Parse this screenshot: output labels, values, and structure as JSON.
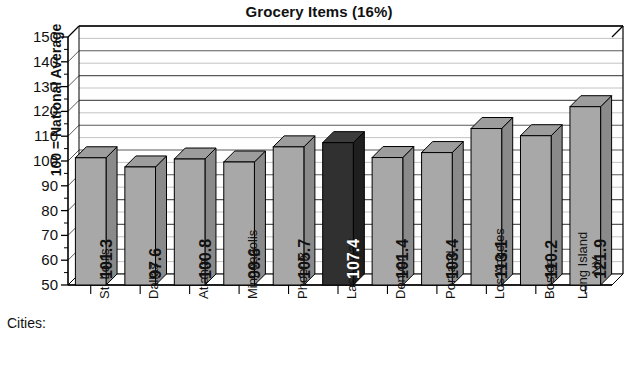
{
  "chart_data": {
    "type": "bar",
    "title": "Grocery Items (16%)",
    "xlabel": "Cities:",
    "ylabel": "100 = National Average",
    "ylim": [
      50,
      150
    ],
    "ytick_step": 10,
    "yticks": [
      150,
      140,
      130,
      120,
      110,
      100,
      90,
      80,
      70,
      60,
      50
    ],
    "grid": true,
    "minor_grid_step": 5,
    "legend": null,
    "three_d": true,
    "categories": [
      "St. Louis",
      "Dallas",
      "Atlanta",
      "Minneapolis",
      "Phoenix",
      "Las Vegas",
      "Denver",
      "Portland",
      "Los Angeles",
      "Boston",
      "Long Island\nNY"
    ],
    "values": [
      101.3,
      97.6,
      100.8,
      99.6,
      105.7,
      107.4,
      101.4,
      103.4,
      113.1,
      110.2,
      121.9
    ],
    "value_labels": [
      "101.3",
      "97.6",
      "100.8",
      "99.6",
      "105.7",
      "107.4",
      "101.4",
      "103.4",
      "113.1",
      "110.2",
      "121.9"
    ],
    "highlight_index": 5,
    "colors": {
      "bar_front": "#a8a8a8",
      "bar_top": "#9d9d9d",
      "bar_side": "#8a8a8a",
      "bar_highlight_front": "#303030",
      "bar_highlight_top": "#3c3c3c",
      "bar_highlight_side": "#1f1f1f",
      "axis": "#000000",
      "gridline_major": "#5a5a5a",
      "gridline_minor": "#b4b4b4",
      "background": "#ffffff",
      "text": "#111111"
    }
  },
  "yticks_text": [
    "150",
    "140",
    "130",
    "120",
    "110",
    "100",
    "90",
    "80",
    "70",
    "60",
    "50"
  ],
  "xticks_text": [
    "St. Louis",
    "Dallas",
    "Atlanta",
    "Minneapolis",
    "Phoenix",
    "Las Vegas",
    "Denver",
    "Portland",
    "Los Angeles",
    "Boston",
    "Long Island"
  ],
  "xtick_second_line": [
    "",
    "",
    "",
    "",
    "",
    "",
    "",
    "",
    "",
    "",
    "NY"
  ]
}
